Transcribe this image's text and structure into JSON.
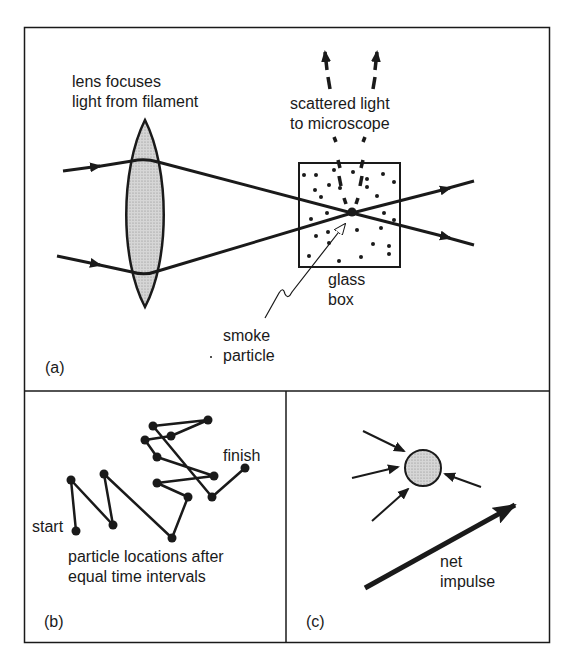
{
  "panel_a": {
    "label": "(a)",
    "lens_caption_line1": "lens focuses",
    "lens_caption_line2": "light from filament",
    "scatter_caption_line1": "scattered light",
    "scatter_caption_line2": "to microscope",
    "box_caption_line1": "glass",
    "box_caption_line2": "box",
    "particle_caption_line1": "smoke",
    "particle_caption_line2": "particle"
  },
  "panel_b": {
    "label": "(b)",
    "start_label": "start",
    "finish_label": "finish",
    "caption_line1": "particle locations after",
    "caption_line2": "equal time intervals",
    "path_points": [
      [
        76,
        531
      ],
      [
        71,
        480
      ],
      [
        113,
        525
      ],
      [
        104,
        474
      ],
      [
        172,
        538
      ],
      [
        188,
        497
      ],
      [
        157,
        483
      ],
      [
        214,
        476
      ],
      [
        157,
        457
      ],
      [
        145,
        440
      ],
      [
        171,
        436
      ],
      [
        208,
        420
      ],
      [
        153,
        426
      ],
      [
        212,
        497
      ],
      [
        245,
        468
      ]
    ]
  },
  "panel_c": {
    "label": "(c)",
    "impulse_caption_line1": "net",
    "impulse_caption_line2": "impulse"
  },
  "colors": {
    "ink": "#1a1a1a",
    "fill_gray": "#bdbdbd",
    "background": "#ffffff"
  }
}
